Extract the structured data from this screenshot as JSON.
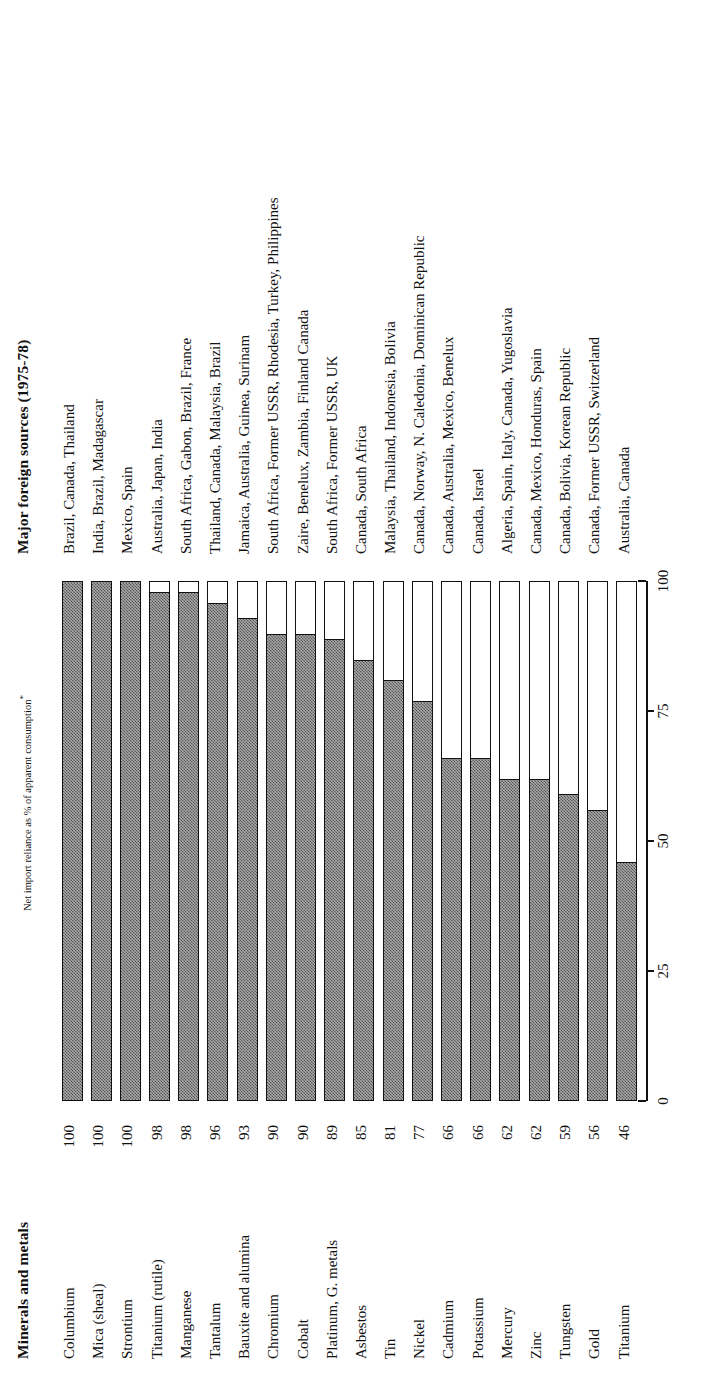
{
  "header": {
    "minerals_title": "Minerals and metals",
    "sources_title": "Major foreign sources (1975-78)",
    "axis_title": "Net import reliance as % of apparent consumption",
    "axis_title_marker": "*"
  },
  "chart_data": {
    "type": "bar",
    "title": "Net import reliance as % of apparent consumption*",
    "xlabel": "",
    "ylabel": "",
    "xlim": [
      0,
      100
    ],
    "grid": false,
    "legend": null,
    "orientation": "horizontal",
    "tick_labels": [
      "0",
      "25",
      "50",
      "75",
      "100"
    ],
    "ticks": [
      0,
      25,
      50,
      75,
      100
    ],
    "categories": [
      "Columbium",
      "Mica (sheal)",
      "Strontium",
      "Titanium (rutile)",
      "Manganese",
      "Tantalum",
      "Bauxite and alumina",
      "Chromium",
      "Cobalt",
      "Platinum, G. metals",
      "Asbestos",
      "Tin",
      "Nickel",
      "Cadmium",
      "Potassium",
      "Mercury",
      "Zinc",
      "Tungsten",
      "Gold",
      "Titanium"
    ],
    "values": [
      100,
      100,
      100,
      98,
      98,
      96,
      93,
      90,
      90,
      89,
      85,
      81,
      77,
      66,
      66,
      62,
      62,
      59,
      56,
      46
    ],
    "sources": [
      "Brazil, Canada, Thailand",
      "India, Brazil, Madagascar",
      "Mexico, Spain",
      "Australia, Japan, India",
      "South Africa, Gabon, Brazil, France",
      "Thailand, Canada, Malaysia, Brazil",
      "Jamaica, Australia, Guinea, Surinam",
      "South Africa, Former USSR, Rhodesia, Turkey, Philippines",
      "Zaire, Benelux, Zambia, Finland Canada",
      "South Africa, Former USSR, UK",
      "Canada, South Africa",
      "Malaysia, Thailand, Indonesia, Bolivia",
      "Canada, Norway, N. Caledonia, Dominican Republic",
      "Canada, Australia, Mexico, Benelux",
      "Canada, Israel",
      "Algeria, Spain, Italy, Canada, Yugoslavia",
      "Canada, Mexico, Honduras, Spain",
      "Canada, Bolivia, Korean Republic",
      "Canada, Former USSR, Switzerland",
      "Australia, Canada"
    ]
  },
  "colors": {
    "bar_fill": "#a9a9a9",
    "bar_outline": "#111111",
    "text": "#111111",
    "background": "#ffffff"
  }
}
